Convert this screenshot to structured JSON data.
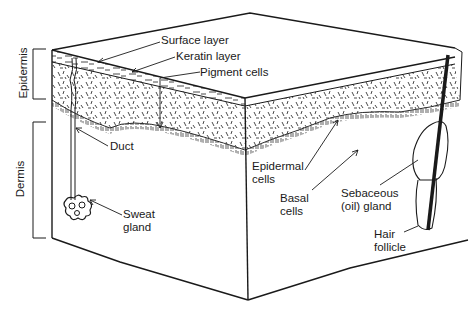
{
  "diagram": {
    "colors": {
      "ink": "#1a1a1a",
      "background": "#ffffff"
    },
    "regions": [
      {
        "id": "epidermis",
        "label": "Epidermis"
      },
      {
        "id": "dermis",
        "label": "Dermis"
      }
    ],
    "labels": {
      "surface_layer": "Surface layer",
      "keratin_layer": "Keratin layer",
      "pigment_cells": "Pigment cells",
      "duct": "Duct",
      "sweat_gland_line1": "Sweat",
      "sweat_gland_line2": "gland",
      "epidermal_cells_line1": "Epidermal",
      "epidermal_cells_line2": "cells",
      "basal_cells_line1": "Basal",
      "basal_cells_line2": "cells",
      "sebaceous_gland_line1": "Sebaceous",
      "sebaceous_gland_line2": "(oil) gland",
      "hair_follicle_line1": "Hair",
      "hair_follicle_line2": "follicle"
    }
  }
}
